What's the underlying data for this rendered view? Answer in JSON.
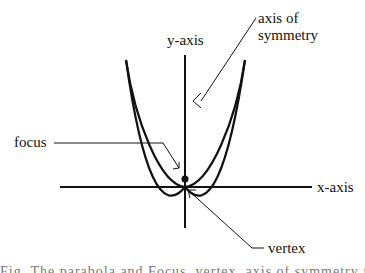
{
  "diagram": {
    "labels": {
      "y_axis": "y-axis",
      "x_axis": "x-axis",
      "axis_of_symmetry_line1": "axis of",
      "axis_of_symmetry_line2": "symmetry",
      "focus": "focus",
      "vertex": "vertex"
    },
    "cutoff_text": "Fig. The parabola and Focus, vertex, axis of symmetry for a parabola",
    "colors": {
      "line": "#111111",
      "background": "#ffffff"
    }
  }
}
